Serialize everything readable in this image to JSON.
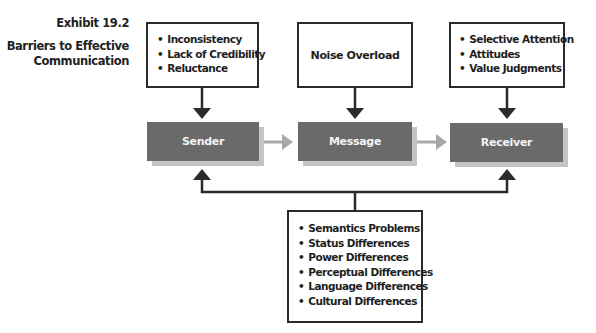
{
  "exhibit": {
    "number": "Exhibit 19.2",
    "title": "Barriers to Effective Communication"
  },
  "top_boxes": {
    "sender_barriers": [
      "Inconsistency",
      "Lack of Credibility",
      "Reluctance"
    ],
    "message_barrier": "Noise Overload",
    "receiver_barriers": [
      "Selective Attention",
      "Attitudes",
      "Value Judgments"
    ]
  },
  "nodes": {
    "sender": "Sender",
    "message": "Message",
    "receiver": "Receiver"
  },
  "bottom_box": {
    "items": [
      "Semantics Problems",
      "Status Differences",
      "Power Differences",
      "Perceptual Differences",
      "Language Differences",
      "Cultural Differences"
    ]
  },
  "colors": {
    "node_fill": "#6a6a6a",
    "node_shadow": "#c4c4c4",
    "flow_arrow": "#a8a8a8",
    "line": "#2a2a2a"
  }
}
